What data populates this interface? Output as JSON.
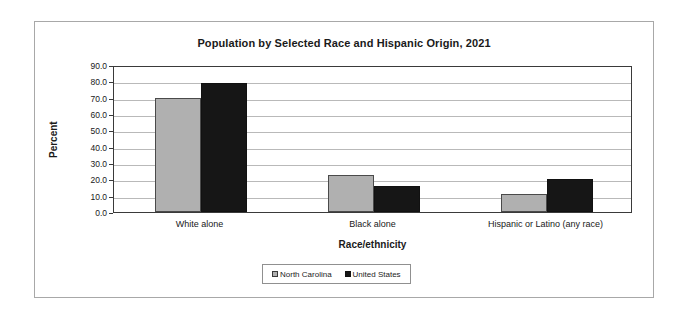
{
  "chart_data": {
    "type": "bar",
    "title": "Population by Selected Race and Hispanic Origin, 2021",
    "xlabel": "Race/ethnicity",
    "ylabel": "Percent",
    "categories": [
      "White alone",
      "Black alone",
      "Hispanic or Latino (any race)"
    ],
    "series": [
      {
        "name": "North Carolina",
        "color": "#b0b0b0",
        "values": [
          70.0,
          22.8,
          11.0
        ]
      },
      {
        "name": "United States",
        "color": "#161616",
        "values": [
          79.0,
          16.0,
          20.5
        ]
      }
    ],
    "ylim": [
      0.0,
      90.0
    ],
    "ytick_step": 10.0,
    "ytick_labels": [
      "90.0",
      "80.0",
      "70.0",
      "60.0",
      "50.0",
      "40.0",
      "30.0",
      "20.0",
      "10.0",
      "0.0"
    ],
    "grid": "horizontal",
    "legend_position": "bottom-center"
  }
}
